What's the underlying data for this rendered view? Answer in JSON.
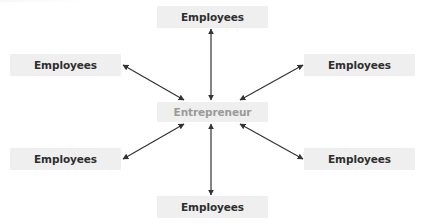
{
  "diagram": {
    "center": {
      "label": "Entrepreneur",
      "text_color": "#9a9a9a"
    },
    "nodes": [
      {
        "label": "Employees",
        "position": "top"
      },
      {
        "label": "Employees",
        "position": "upper-left"
      },
      {
        "label": "Employees",
        "position": "upper-right"
      },
      {
        "label": "Employees",
        "position": "lower-left"
      },
      {
        "label": "Employees",
        "position": "lower-right"
      },
      {
        "label": "Employees",
        "position": "bottom"
      }
    ],
    "connector": "bidirectional-arrow",
    "colors": {
      "box_fill": "#efefef",
      "text": "#2e2e2e",
      "arrow": "#333333"
    }
  }
}
